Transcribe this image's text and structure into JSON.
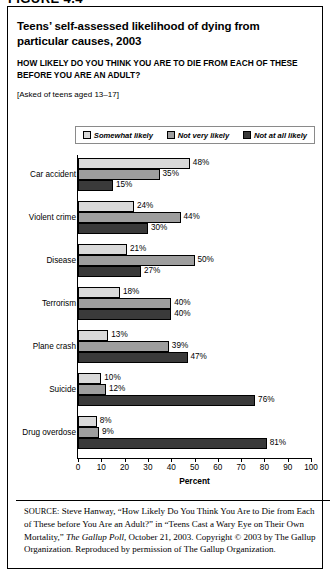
{
  "figure_label": "FIGURE 4.4",
  "title": "Teens’ self-assessed likelihood of dying from particular causes, 2003",
  "subtitle": "HOW LIKELY DO YOU THINK YOU ARE TO DIE FROM EACH OF THESE BEFORE YOU ARE AN ADULT?",
  "asked_note": "[Asked of teens aged 13–17]",
  "legend": {
    "items": [
      {
        "label": "Somewhat likely",
        "color": "#d9d9d9"
      },
      {
        "label": "Not very likely",
        "color": "#9e9e9e"
      },
      {
        "label": "Not at all likely",
        "color": "#3a3a3a"
      }
    ]
  },
  "source": {
    "prefix": "SOURCE:",
    "body_1": " Steve Hanway, “How Likely Do You Think You Are to Die from Each of These before You Are an Adult?” in “Teens Cast a Wary Eye on Their Own Mortality,” ",
    "italic_title": "The Gallup Poll",
    "body_2": ", October 21, 2003. Copyright © 2003 by The Gallup Organization. Reproduced by permission of The Gallup Organization."
  },
  "chart_data": {
    "type": "bar",
    "orientation": "horizontal",
    "title": "Teens’ self-assessed likelihood of dying from particular causes, 2003",
    "xlabel": "Percent",
    "ylabel": "",
    "xlim": [
      0,
      100
    ],
    "xticks": [
      0,
      10,
      20,
      30,
      40,
      50,
      60,
      70,
      80,
      90,
      100
    ],
    "grid": false,
    "legend_position": "top",
    "categories": [
      "Car accident",
      "Violent crime",
      "Disease",
      "Terrorism",
      "Plane crash",
      "Suicide",
      "Drug overdose"
    ],
    "series": [
      {
        "name": "Somewhat likely",
        "color": "#d9d9d9",
        "values": [
          48,
          24,
          21,
          18,
          13,
          10,
          8
        ],
        "labels": [
          "48%",
          "24%",
          "21%",
          "18%",
          "13%",
          "10%",
          "8%"
        ]
      },
      {
        "name": "Not very likely",
        "color": "#9e9e9e",
        "values": [
          35,
          44,
          50,
          40,
          39,
          12,
          9
        ],
        "labels": [
          "35%",
          "44%",
          "50%",
          "40%",
          "39%",
          "12%",
          "9%"
        ]
      },
      {
        "name": "Not at all likely",
        "color": "#3a3a3a",
        "values": [
          15,
          30,
          27,
          40,
          47,
          76,
          81
        ],
        "labels": [
          "15%",
          "30%",
          "27%",
          "40%",
          "47%",
          "76%",
          "81%"
        ]
      }
    ]
  }
}
